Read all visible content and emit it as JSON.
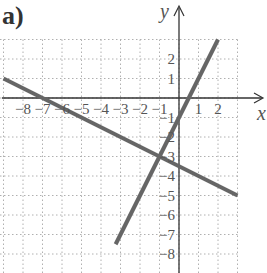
{
  "figure": {
    "label": "a)"
  },
  "chart_data": {
    "type": "line",
    "title": "",
    "panel_label": "a)",
    "xlabel": "x",
    "ylabel": "y",
    "xlim": [
      -9,
      3.5
    ],
    "ylim": [
      -9.5,
      4
    ],
    "grid": true,
    "grid_style": "dotted",
    "x_ticks": [
      -8,
      -7,
      -6,
      -5,
      -4,
      -3,
      -2,
      -1,
      1,
      2
    ],
    "x_tick_labels": [
      "−8",
      "−7",
      "−6",
      "−5",
      "−4",
      "−3",
      "−2",
      "−1",
      "1",
      "2"
    ],
    "y_ticks": [
      2,
      1,
      -1,
      -2,
      -3,
      -4,
      -5,
      -6,
      -7,
      -8
    ],
    "y_tick_labels": [
      "2",
      "1",
      "−1",
      "−2",
      "−3",
      "−4",
      "−5",
      "−6",
      "−7",
      "−8"
    ],
    "series": [
      {
        "name": "line 1",
        "equation": "y = -x/2 - 7/2",
        "points": [
          [
            -9,
            1
          ],
          [
            3,
            -5
          ]
        ],
        "color": "#666666"
      },
      {
        "name": "line 2",
        "equation": "y = 2x - 1",
        "points": [
          [
            -3.25,
            -7.5
          ],
          [
            2,
            3
          ]
        ],
        "color": "#666666"
      }
    ],
    "intersection": [
      -1,
      -3
    ],
    "legend": null
  },
  "style": {
    "axis_color": "#333333",
    "grid_color": "#b0b0b0",
    "line_color": "#666666",
    "text_color": "#555555"
  }
}
